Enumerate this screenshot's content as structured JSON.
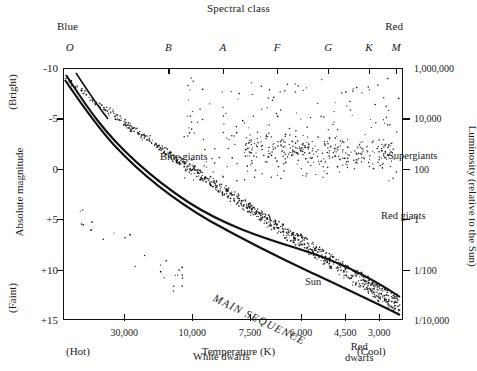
{
  "chart_data": {
    "type": "scatter",
    "title": "Spectral class",
    "xlabel": "Temperature (K)",
    "ylabel": "Absolute magnitude",
    "y2label": "Luminosity (relative to the Sun)",
    "grid": false,
    "legend_position": "none",
    "top_axis": {
      "name": "Spectral class",
      "left_end_label": "Blue",
      "right_end_label": "Red",
      "ticks": [
        "O",
        "B",
        "A",
        "F",
        "G",
        "K",
        "M"
      ],
      "tick_positions_pct": [
        2,
        31,
        47,
        63,
        78,
        90,
        98
      ]
    },
    "x_axis": {
      "label": "Temperature (K)",
      "left_end_label": "(Hot)",
      "right_end_label": "(Cool)",
      "tick_labels": [
        "30,000",
        "10,000",
        "7,500",
        "6,000",
        "4,500",
        "3,000"
      ],
      "tick_positions_pct": [
        18,
        38,
        55,
        70,
        83,
        93
      ],
      "direction": "decreasing"
    },
    "y_axis": {
      "label": "Absolute magnitude",
      "top_end_label": "(Bright)",
      "bottom_end_label": "(Faint)",
      "tick_labels": [
        "-10",
        "-5",
        "0",
        "+5",
        "+10",
        "+15"
      ],
      "ylim": [
        -10,
        15
      ],
      "direction": "inverted"
    },
    "y2_axis": {
      "label": "Luminosity (relative to the Sun)",
      "tick_labels": [
        "1,000,000",
        "10,000",
        "100",
        "1",
        "1/100",
        "1/10,000"
      ]
    },
    "annotations": [
      {
        "text": "Blue giants",
        "x_pct": 10,
        "y_pct": 6
      },
      {
        "text": "Supergiants",
        "x_pct": 77,
        "y_pct": 5
      },
      {
        "text": "Red giants",
        "x_pct": 75,
        "y_pct": 29
      },
      {
        "text": "Sun",
        "x_pct": 53,
        "y_pct": 55
      },
      {
        "text": "MAIN SEQUENCE",
        "x_pct": 26,
        "y_pct": 61,
        "rotation": 26
      },
      {
        "text": "White dwarfs",
        "x_pct": 20,
        "y_pct": 85
      },
      {
        "text": "Red dwarfs",
        "x_pct": 65,
        "y_pct": 81
      }
    ],
    "series": [
      {
        "name": "Main sequence band",
        "description": "Dense diagonal band from upper-left (hot, bright) to lower-right (cool, faint)"
      },
      {
        "name": "Giants and supergiants",
        "description": "Scatter in upper-right region"
      },
      {
        "name": "White dwarfs",
        "description": "Sparse scatter lower-left region"
      }
    ]
  },
  "chart": {
    "title": "Spectral class",
    "blue_label": "Blue",
    "red_label": "Red",
    "hot_label": "(Hot)",
    "cool_label": "(Cool)",
    "bright_label": "(Bright)",
    "faint_label": "(Faint)",
    "y_title": "Absolute magnitude",
    "y2_title": "Luminosity (relative to the Sun)",
    "x_title": "Temperature (K)",
    "spectral_ticks": [
      "O",
      "B",
      "A",
      "F",
      "G",
      "K",
      "M"
    ],
    "y_ticks": [
      "-10",
      "-5",
      "0",
      "+5",
      "+10",
      "+15"
    ],
    "y2_ticks": [
      "1,000,000",
      "10,000",
      "100",
      "1",
      "1/100",
      "1/10,000"
    ],
    "x_ticks": [
      "30,000",
      "10,000",
      "7,500",
      "6,000",
      "4,500",
      "3,000"
    ],
    "labels": {
      "blue_giants": "Blue giants",
      "supergiants": "Supergiants",
      "red_giants": "Red giants",
      "sun": "Sun",
      "main_sequence": "MAIN SEQUENCE",
      "white_dwarfs": "White dwarfs",
      "red_dwarfs_line1": "Red",
      "red_dwarfs_line2": "dwarfs"
    },
    "colors": {
      "ink": "#111111",
      "background": "#ffffff"
    }
  }
}
